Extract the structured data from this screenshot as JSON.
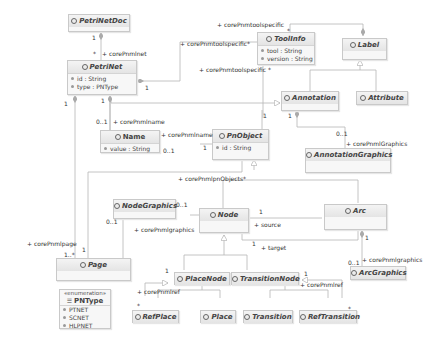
{
  "classes": {
    "petrinetdoc": {
      "name": "PetriNetDoc"
    },
    "petrinet": {
      "name": "PetriNet",
      "attributes": [
        "id : String",
        "type : PNType"
      ]
    },
    "toolinfo": {
      "name": "ToolInfo",
      "attributes": [
        "tool : String",
        "version : String"
      ]
    },
    "label": {
      "name": "Label"
    },
    "annotation": {
      "name": "Annotation"
    },
    "attribute": {
      "name": "Attribute"
    },
    "name": {
      "name": "Name",
      "attributes": [
        "value : String"
      ]
    },
    "pnobject": {
      "name": "PnObject",
      "attributes": [
        "id : String"
      ]
    },
    "annotationgraphics": {
      "name": "AnnotationGraphics"
    },
    "nodegraphics": {
      "name": "NodeGraphics"
    },
    "node": {
      "name": "Node"
    },
    "arc": {
      "name": "Arc"
    },
    "page": {
      "name": "Page"
    },
    "arcgraphics": {
      "name": "ArcGraphics"
    },
    "placenode": {
      "name": "PlaceNode"
    },
    "transitionnode": {
      "name": "TransitionNode"
    },
    "refplace": {
      "name": "RefPlace"
    },
    "place": {
      "name": "Place"
    },
    "transition": {
      "name": "Transition"
    },
    "reftransition": {
      "name": "RefTransition"
    }
  },
  "enumeration": {
    "stereotype": "«enumeration»",
    "name": "PNType",
    "literals": [
      "PTNET",
      "SCNET",
      "HLPNET"
    ]
  },
  "labels": {
    "l1": "+ corePnmtoolspecific",
    "l2": "*",
    "l3": "1",
    "l4": "*",
    "l5": "+ corePnmlnet",
    "l6": "+ corePnmtoolspecific",
    "l7": "*",
    "l8": "1",
    "l9": "+ corePnmtoolspecific",
    "l10": "*",
    "l11": "1",
    "l12": "1",
    "l13": "1",
    "l14": "0..1",
    "l15": "+ corePnmlname",
    "l16": "+ corePnmlname",
    "l17": "0..1",
    "l18": "1",
    "l19": "1",
    "l20": "0..1",
    "l21": "+ corePnmlGraphics",
    "l22": "+ corePnmlpnObjects",
    "l23": "*",
    "l24": "0..1",
    "l25": "0..1",
    "l26": "+ corePnmlgraphics",
    "l27": "1",
    "l28": "+ source",
    "l29": "1",
    "l30": "+ target",
    "l31": "+ corePnmlpage",
    "l32": "1..*",
    "l33": "1",
    "l34": "1",
    "l35": "0..1",
    "l36": "+ corePnmlgraphics",
    "l37": "1",
    "l38": "+ corePnmlref",
    "l39": "*",
    "l40": "1",
    "l41": "+ corePnmlref",
    "l42": "*"
  }
}
